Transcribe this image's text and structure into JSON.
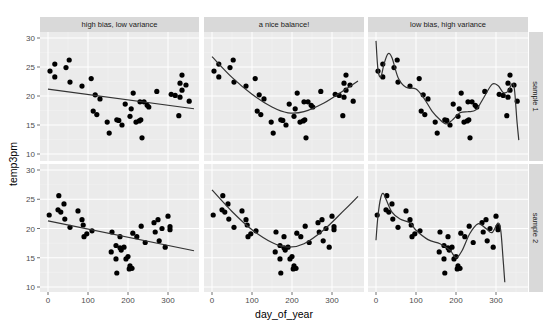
{
  "chart_data": {
    "type": "scatter",
    "title": "",
    "xlabel": "day_of_year",
    "ylabel": "temp3pm",
    "xlim": [
      -20,
      380
    ],
    "ylim": [
      9.5,
      31.5
    ],
    "x_ticks": [
      0,
      100,
      200,
      300
    ],
    "y_ticks": [
      10,
      15,
      20,
      25,
      30
    ],
    "grid": true,
    "facet_columns": [
      "high bias, low variance",
      "a nice balance!",
      "low bias, high variance"
    ],
    "facet_rows": [
      "sample 1",
      "sample 2"
    ],
    "panels": [
      {
        "row": "sample 1",
        "column": "high bias, low variance",
        "fit": "linear",
        "fit_curve": [
          [
            0,
            21.2
          ],
          [
            365,
            17.8
          ]
        ]
      },
      {
        "row": "sample 1",
        "column": "a nice balance!",
        "fit": "quadratic",
        "fit_curve": [
          [
            0,
            26.8
          ],
          [
            50,
            23.2
          ],
          [
            100,
            20.3
          ],
          [
            150,
            18.1
          ],
          [
            190,
            17.1
          ],
          [
            230,
            17.3
          ],
          [
            280,
            18.8
          ],
          [
            330,
            21.0
          ],
          [
            365,
            22.6
          ]
        ]
      },
      {
        "row": "sample 1",
        "column": "low bias, high variance",
        "fit": "high-order polynomial",
        "fit_curve": [
          [
            0,
            29.5
          ],
          [
            5,
            24.5
          ],
          [
            12,
            23.3
          ],
          [
            20,
            25.5
          ],
          [
            30,
            27.3
          ],
          [
            40,
            26.6
          ],
          [
            55,
            23.2
          ],
          [
            75,
            21.5
          ],
          [
            100,
            21.2
          ],
          [
            120,
            19.6
          ],
          [
            140,
            17.4
          ],
          [
            160,
            15.9
          ],
          [
            175,
            15.2
          ],
          [
            190,
            15.8
          ],
          [
            210,
            17.1
          ],
          [
            230,
            17.3
          ],
          [
            250,
            17.6
          ],
          [
            270,
            19.8
          ],
          [
            290,
            22.0
          ],
          [
            305,
            21.8
          ],
          [
            318,
            20.6
          ],
          [
            330,
            20.8
          ],
          [
            340,
            22.1
          ],
          [
            346,
            21.2
          ],
          [
            352,
            16.0
          ],
          [
            357,
            12.4
          ]
        ]
      },
      {
        "row": "sample 2",
        "column": "high bias, low variance",
        "fit": "linear",
        "fit_curve": [
          [
            0,
            21.3
          ],
          [
            365,
            16.2
          ]
        ]
      },
      {
        "row": "sample 2",
        "column": "a nice balance!",
        "fit": "quadratic",
        "fit_curve": [
          [
            0,
            26.6
          ],
          [
            50,
            22.9
          ],
          [
            100,
            19.8
          ],
          [
            150,
            17.6
          ],
          [
            190,
            16.8
          ],
          [
            230,
            17.4
          ],
          [
            280,
            19.8
          ],
          [
            330,
            23.1
          ],
          [
            365,
            25.5
          ]
        ]
      },
      {
        "row": "sample 2",
        "column": "low bias, high variance",
        "fit": "high-order polynomial",
        "fit_curve": [
          [
            0,
            18.0
          ],
          [
            5,
            22.2
          ],
          [
            12,
            25.3
          ],
          [
            18,
            26.0
          ],
          [
            25,
            25.0
          ],
          [
            40,
            22.8
          ],
          [
            60,
            21.6
          ],
          [
            85,
            21.0
          ],
          [
            100,
            19.7
          ],
          [
            130,
            18.1
          ],
          [
            160,
            17.4
          ],
          [
            185,
            16.3
          ],
          [
            200,
            15.0
          ],
          [
            215,
            16.2
          ],
          [
            235,
            19.2
          ],
          [
            255,
            20.8
          ],
          [
            275,
            20.0
          ],
          [
            290,
            19.3
          ],
          [
            305,
            20.9
          ],
          [
            312,
            19.6
          ],
          [
            318,
            14.5
          ],
          [
            322,
            10.8
          ]
        ]
      }
    ],
    "series": [
      {
        "name": "sample 1",
        "x": [
          5,
          17,
          17,
          45,
          53,
          55,
          85,
          108,
          118,
          130,
          113,
          122,
          148,
          153,
          172,
          177,
          185,
          193,
          208,
          205,
          213,
          220,
          228,
          232,
          230,
          240,
          248,
          252,
          235,
          272,
          308,
          318,
          330,
          327,
          335,
          330,
          345,
          335,
          353
        ],
        "y": [
          24.3,
          25.5,
          23.3,
          24.9,
          26.2,
          22.4,
          21.7,
          23.0,
          20.2,
          19.5,
          17.4,
          16.8,
          15.5,
          13.6,
          15.9,
          15.8,
          15.0,
          18.6,
          17.8,
          16.5,
          20.5,
          15.5,
          15.7,
          15.9,
          19.0,
          19.0,
          18.4,
          18.1,
          12.8,
          20.8,
          20.3,
          20.1,
          19.8,
          16.6,
          23.6,
          22.2,
          21.9,
          21.0,
          19.1
        ]
      },
      {
        "name": "sample 2",
        "x": [
          3,
          27,
          25,
          32,
          40,
          42,
          55,
          75,
          85,
          88,
          90,
          97,
          110,
          160,
          158,
          170,
          180,
          190,
          183,
          170,
          172,
          180,
          195,
          200,
          205,
          210,
          203,
          212,
          222,
          233,
          243,
          265,
          275,
          268,
          278,
          285,
          293,
          300,
          305,
          305
        ],
        "y": [
          22.3,
          25.6,
          23.2,
          22.8,
          24.2,
          21.6,
          20.2,
          23.0,
          21.5,
          20.6,
          18.6,
          19.1,
          19.6,
          19.4,
          16.0,
          17.1,
          16.7,
          16.8,
          16.3,
          14.8,
          12.4,
          18.6,
          14.8,
          15.2,
          13.6,
          13.2,
          13.1,
          19.2,
          18.6,
          20.4,
          17.6,
          21.0,
          21.5,
          19.4,
          17.9,
          20.0,
          16.8,
          22.1,
          20.3,
          19.8
        ]
      }
    ]
  },
  "style": {
    "panel_bg": "#ebebeb",
    "strip_bg": "#d9d9d9",
    "grid_major": "#ffffff",
    "point_color": "#000000",
    "line_color": "#333333"
  }
}
